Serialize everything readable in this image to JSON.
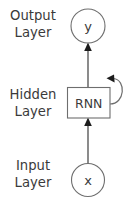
{
  "diagram": {
    "background_color": "#ffffff",
    "stroke_color": "#6e6e6e",
    "text_color": "#3a3a3a",
    "arrow_color": "#1c1c1c",
    "labels": {
      "output_layer": {
        "line1": "Output",
        "line2": "Layer"
      },
      "hidden_layer": {
        "line1": "Hidden",
        "line2": "Layer"
      },
      "input_layer": {
        "line1": "Input",
        "line2": "Layer"
      }
    },
    "nodes": {
      "output_node": {
        "text": "y",
        "shape": "circle"
      },
      "hidden_node": {
        "text": "RNN",
        "shape": "rectangle"
      },
      "input_node": {
        "text": "x",
        "shape": "circle"
      }
    },
    "edges": [
      {
        "name": "input-to-hidden",
        "from": "x",
        "to": "RNN",
        "style": "solid-arrow"
      },
      {
        "name": "hidden-to-output",
        "from": "RNN",
        "to": "y",
        "style": "solid-arrow"
      },
      {
        "name": "hidden-self-loop",
        "from": "RNN",
        "to": "RNN",
        "style": "curved-self-loop-arrow"
      }
    ]
  }
}
